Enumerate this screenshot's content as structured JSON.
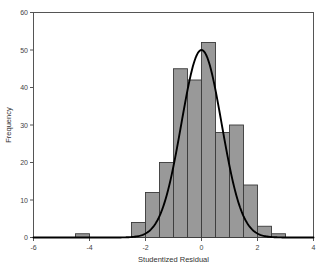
{
  "chart_data": {
    "type": "bar",
    "title": "",
    "subtitle": "",
    "xlabel": "Studentized Residual",
    "ylabel": "Frequency",
    "xlim": [
      -6,
      4
    ],
    "ylim": [
      0,
      60
    ],
    "xticks": [
      -6,
      -4,
      -2,
      0,
      2,
      4
    ],
    "xtick_labels": [
      "-6",
      "-4",
      "-2",
      "0",
      "2",
      "4"
    ],
    "yticks": [
      0,
      10,
      20,
      30,
      40,
      50,
      60
    ],
    "ytick_labels": [
      "0",
      "10",
      "20",
      "30",
      "40",
      "50",
      "60"
    ],
    "grid": false,
    "legend": null,
    "bin_width": 0.5,
    "bin_starts": [
      -4.5,
      -2.5,
      -2.0,
      -1.5,
      -1.0,
      -0.5,
      0.0,
      0.5,
      1.0,
      1.5,
      2.0,
      2.5
    ],
    "categories": [
      "-4.5",
      "-2.5",
      "-2.0",
      "-1.5",
      "-1.0",
      "-0.5",
      "0.0",
      "0.5",
      "1.0",
      "1.5",
      "2.0",
      "2.5"
    ],
    "values": [
      1,
      4,
      12,
      20,
      45,
      42,
      52,
      28,
      30,
      14,
      3,
      1
    ],
    "bar_fill": "#999999",
    "bar_edge": "#3a3a3a",
    "overlay": {
      "type": "line",
      "name": "normal-curve",
      "color": "#000000",
      "peak_x": 0.0,
      "peak_y": 50,
      "mean": 0.0,
      "sigma": 0.72
    }
  },
  "axes": {
    "frame_color": "#555555",
    "background": "#ffffff"
  }
}
